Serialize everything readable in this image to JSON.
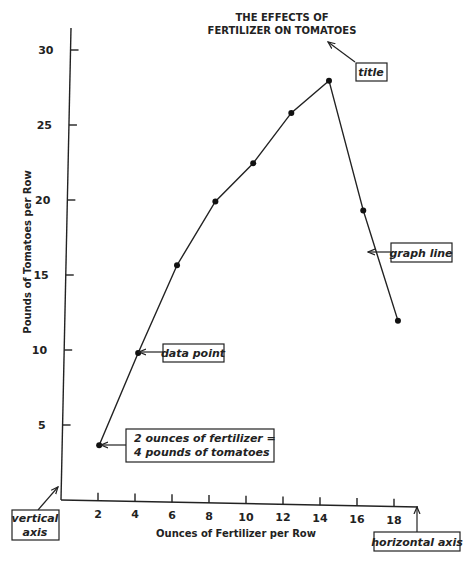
{
  "chart_data": {
    "type": "line",
    "title_lines": [
      "THE EFFECTS OF",
      "FERTILIZER ON TOMATOES"
    ],
    "xlabel": "Ounces of Fertilizer per Row",
    "ylabel": "Pounds of Tomatoes per Row",
    "x_ticks": [
      2,
      4,
      6,
      8,
      10,
      12,
      14,
      16,
      18
    ],
    "y_ticks": [
      5,
      10,
      15,
      20,
      25,
      30
    ],
    "xlim": [
      0,
      19.5
    ],
    "ylim": [
      0,
      32
    ],
    "grid": false,
    "series": [
      {
        "name": "graph line",
        "x": [
          2,
          4,
          6,
          8,
          10,
          12,
          14,
          16,
          18
        ],
        "y": [
          3.7,
          9.9,
          15.8,
          20.1,
          22.7,
          26.1,
          28.3,
          19.7,
          12.4
        ]
      }
    ],
    "annotations": {
      "title": "title",
      "graph_line": "graph line",
      "data_point": "data point",
      "example_lines": [
        "2 ounces of fertilizer =",
        "4 pounds of tomatoes"
      ],
      "vertical_axis_lines": [
        "vertical",
        "axis"
      ],
      "horizontal_axis": "horizontal axis"
    }
  }
}
